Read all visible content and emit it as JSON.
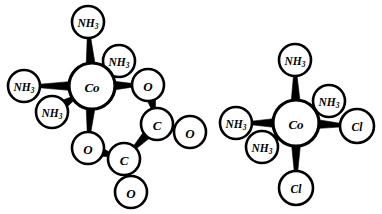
{
  "figure": {
    "background_color": "#ffffff",
    "line_color": "#000000",
    "width": 382,
    "height": 214
  },
  "structures": [
    {
      "id": "left-complex",
      "name": "tetraamminecobalt-oxalate-complex",
      "center": {
        "label": "Co",
        "sub": "",
        "x": 92,
        "y": 86,
        "r": 23
      },
      "atoms": [
        {
          "id": "l-nh3-top",
          "label": "NH",
          "sub": "3",
          "x": 88,
          "y": 22,
          "r": 16
        },
        {
          "id": "l-nh3-left",
          "label": "NH",
          "sub": "3",
          "x": 24,
          "y": 86,
          "r": 16
        },
        {
          "id": "l-nh3-upper-right",
          "label": "NH",
          "sub": "3",
          "x": 119,
          "y": 61,
          "r": 16
        },
        {
          "id": "l-nh3-lower-left",
          "label": "NH",
          "sub": "3",
          "x": 52,
          "y": 112,
          "r": 16
        },
        {
          "id": "l-o-upper",
          "label": "O",
          "sub": "",
          "x": 148,
          "y": 85,
          "r": 16
        },
        {
          "id": "l-o-lower",
          "label": "O",
          "sub": "",
          "x": 88,
          "y": 148,
          "r": 16
        },
        {
          "id": "l-c-upper",
          "label": "C",
          "sub": "",
          "x": 157,
          "y": 124,
          "r": 16
        },
        {
          "id": "l-c-lower",
          "label": "C",
          "sub": "",
          "x": 124,
          "y": 159,
          "r": 16
        },
        {
          "id": "l-o-term-right",
          "label": "O",
          "sub": "",
          "x": 190,
          "y": 132,
          "r": 16
        },
        {
          "id": "l-o-term-bottom",
          "label": "O",
          "sub": "",
          "x": 131,
          "y": 192,
          "r": 16
        }
      ],
      "bonds": [
        {
          "from": "center",
          "to": "l-nh3-top",
          "style": "wedge-out"
        },
        {
          "from": "center",
          "to": "l-nh3-left",
          "style": "wedge-out"
        },
        {
          "from": "l-nh3-upper-right",
          "to": "center",
          "style": "wedge-in"
        },
        {
          "from": "l-nh3-lower-left",
          "to": "center",
          "style": "wedge-in"
        },
        {
          "from": "center",
          "to": "l-o-upper",
          "style": "wedge-out"
        },
        {
          "from": "center",
          "to": "l-o-lower",
          "style": "wedge-out"
        },
        {
          "from": "l-o-upper",
          "to": "l-c-upper",
          "style": "wedge-out"
        },
        {
          "from": "l-o-lower",
          "to": "l-c-lower",
          "style": "wedge-out"
        },
        {
          "from": "l-c-upper",
          "to": "l-c-lower",
          "style": "wedge-out"
        },
        {
          "from": "l-c-upper",
          "to": "l-o-term-right",
          "style": "wedge-out"
        },
        {
          "from": "l-c-lower",
          "to": "l-o-term-bottom",
          "style": "wedge-out"
        }
      ]
    },
    {
      "id": "right-complex",
      "name": "tetraamminedichlorocobalt-complex",
      "center": {
        "label": "Co",
        "sub": "",
        "x": 296,
        "y": 123,
        "r": 23
      },
      "atoms": [
        {
          "id": "r-nh3-top",
          "label": "NH",
          "sub": "3",
          "x": 295,
          "y": 60,
          "r": 16
        },
        {
          "id": "r-nh3-left",
          "label": "NH",
          "sub": "3",
          "x": 236,
          "y": 123,
          "r": 16
        },
        {
          "id": "r-nh3-upper-right",
          "label": "NH",
          "sub": "3",
          "x": 329,
          "y": 101,
          "r": 16
        },
        {
          "id": "r-nh3-lower-left",
          "label": "NH",
          "sub": "3",
          "x": 262,
          "y": 147,
          "r": 16
        },
        {
          "id": "r-cl-right",
          "label": "Cl",
          "sub": "",
          "x": 357,
          "y": 126,
          "r": 17
        },
        {
          "id": "r-cl-bottom",
          "label": "Cl",
          "sub": "",
          "x": 296,
          "y": 188,
          "r": 17
        }
      ],
      "bonds": [
        {
          "from": "center",
          "to": "r-nh3-top",
          "style": "wedge-out"
        },
        {
          "from": "center",
          "to": "r-nh3-left",
          "style": "wedge-out"
        },
        {
          "from": "r-nh3-upper-right",
          "to": "center",
          "style": "wedge-in"
        },
        {
          "from": "r-nh3-lower-left",
          "to": "center",
          "style": "wedge-in"
        },
        {
          "from": "center",
          "to": "r-cl-right",
          "style": "wedge-out"
        },
        {
          "from": "center",
          "to": "r-cl-bottom",
          "style": "wedge-out"
        }
      ]
    }
  ]
}
